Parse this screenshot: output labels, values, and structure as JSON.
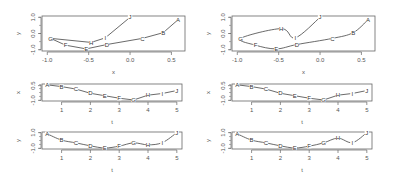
{
  "chart_data": [
    {
      "type": "line",
      "panel": "top-left",
      "title": "",
      "xlabel": "x",
      "ylabel": "y",
      "xlim": [
        -1.0,
        0.6
      ],
      "ylim": [
        -1.0,
        1.0
      ],
      "xticks": [
        "-1.0",
        "-0.5",
        "0.0",
        "0.5"
      ],
      "yticks": [
        "-1.0",
        "0.0",
        "1.0"
      ],
      "points": [
        {
          "label": "A",
          "x": 0.58,
          "y": 0.85
        },
        {
          "label": "B",
          "x": 0.4,
          "y": 0.05
        },
        {
          "label": "C",
          "x": 0.15,
          "y": -0.3
        },
        {
          "label": "D",
          "x": -0.28,
          "y": -0.68
        },
        {
          "label": "E",
          "x": -0.53,
          "y": -0.95
        },
        {
          "label": "F",
          "x": -0.78,
          "y": -0.72
        },
        {
          "label": "G",
          "x": -0.96,
          "y": -0.3
        },
        {
          "label": "H",
          "x": -0.47,
          "y": -0.55
        },
        {
          "label": "I",
          "x": -0.3,
          "y": -0.27
        },
        {
          "label": "J",
          "x": 0.0,
          "y": 1.0
        }
      ],
      "curve": "piecewise linear"
    },
    {
      "type": "line",
      "panel": "top-right",
      "title": "",
      "xlabel": "x",
      "ylabel": "y",
      "xlim": [
        -1.0,
        0.6
      ],
      "ylim": [
        -1.0,
        1.0
      ],
      "xticks": [
        "-1.0",
        "-0.5",
        "0.0",
        "0.5"
      ],
      "yticks": [
        "-1.0",
        "0.0",
        "1.0"
      ],
      "points": [
        {
          "label": "A",
          "x": 0.58,
          "y": 0.85
        },
        {
          "label": "B",
          "x": 0.4,
          "y": 0.05
        },
        {
          "label": "C",
          "x": 0.15,
          "y": -0.3
        },
        {
          "label": "D",
          "x": -0.28,
          "y": -0.68
        },
        {
          "label": "E",
          "x": -0.53,
          "y": -0.95
        },
        {
          "label": "F",
          "x": -0.78,
          "y": -0.72
        },
        {
          "label": "G",
          "x": -0.96,
          "y": -0.3
        },
        {
          "label": "H",
          "x": -0.47,
          "y": 0.3
        },
        {
          "label": "I",
          "x": -0.3,
          "y": -0.27
        },
        {
          "label": "J",
          "x": 0.0,
          "y": 1.0
        }
      ],
      "curve": "smooth spline"
    },
    {
      "type": "line",
      "panel": "middle-left",
      "xlabel": "t",
      "ylabel": "x",
      "xlim": [
        0.5,
        5.0
      ],
      "ylim": [
        -1.0,
        0.6
      ],
      "xticks": [
        "1",
        "2",
        "3",
        "4",
        "5"
      ],
      "yticks": [
        "-1.0",
        "0.5"
      ],
      "t": [
        0.5,
        1.0,
        1.5,
        2.0,
        2.5,
        3.0,
        3.5,
        4.0,
        4.5,
        5.0
      ],
      "labels": [
        "A",
        "B",
        "C",
        "D",
        "E",
        "F",
        "G",
        "H",
        "I",
        "J"
      ],
      "values": [
        0.58,
        0.4,
        0.15,
        -0.28,
        -0.53,
        -0.78,
        -0.96,
        -0.47,
        -0.3,
        0.0
      ]
    },
    {
      "type": "line",
      "panel": "middle-right",
      "xlabel": "t",
      "ylabel": "x",
      "xlim": [
        0.5,
        5.0
      ],
      "ylim": [
        -1.0,
        0.6
      ],
      "xticks": [
        "1",
        "2",
        "3",
        "4",
        "5"
      ],
      "yticks": [
        "-1.0",
        "0.5"
      ],
      "t": [
        0.5,
        1.0,
        1.5,
        2.0,
        2.5,
        3.0,
        3.5,
        4.0,
        4.5,
        5.0
      ],
      "labels": [
        "A",
        "B",
        "C",
        "D",
        "E",
        "F",
        "G",
        "H",
        "I",
        "J"
      ],
      "values": [
        0.58,
        0.4,
        0.15,
        -0.28,
        -0.53,
        -0.78,
        -0.96,
        -0.47,
        -0.3,
        0.0
      ]
    },
    {
      "type": "line",
      "panel": "bottom-left",
      "xlabel": "t",
      "ylabel": "y",
      "xlim": [
        0.5,
        5.0
      ],
      "ylim": [
        -1.0,
        1.0
      ],
      "xticks": [
        "1",
        "2",
        "3",
        "4",
        "5"
      ],
      "yticks": [
        "-1.0",
        "1.0"
      ],
      "t": [
        0.5,
        1.0,
        1.5,
        2.0,
        2.5,
        3.0,
        3.5,
        4.0,
        4.5,
        5.0
      ],
      "labels": [
        "A",
        "B",
        "C",
        "D",
        "E",
        "F",
        "G",
        "H",
        "I",
        "J"
      ],
      "values": [
        0.85,
        0.05,
        -0.3,
        -0.68,
        -0.95,
        -0.72,
        -0.3,
        -0.55,
        -0.27,
        1.0
      ]
    },
    {
      "type": "line",
      "panel": "bottom-right",
      "xlabel": "t",
      "ylabel": "y",
      "xlim": [
        0.5,
        5.0
      ],
      "ylim": [
        -1.0,
        1.0
      ],
      "xticks": [
        "1",
        "2",
        "3",
        "4",
        "5"
      ],
      "yticks": [
        "-1.0",
        "1.0"
      ],
      "t": [
        0.5,
        1.0,
        1.5,
        2.0,
        2.5,
        3.0,
        3.5,
        4.0,
        4.5,
        5.0
      ],
      "labels": [
        "A",
        "B",
        "C",
        "D",
        "E",
        "F",
        "G",
        "H",
        "I",
        "J"
      ],
      "values": [
        0.85,
        0.05,
        -0.3,
        -0.68,
        -0.95,
        -0.72,
        -0.3,
        0.3,
        -0.27,
        1.0
      ]
    }
  ],
  "style": {
    "line_color": "#444444",
    "frame_color": "#666666",
    "text_color": "#555555",
    "background": "#ffffff"
  }
}
